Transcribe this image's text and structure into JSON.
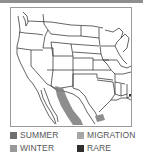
{
  "map": {
    "title": "Range map",
    "region": "United States and northern Mexico",
    "range_color": "#7a7a7a"
  },
  "legend": {
    "items": [
      {
        "label": "SUMMER",
        "color": "#6f6f6f"
      },
      {
        "label": "MIGRATION",
        "color": "#a6a6a6"
      },
      {
        "label": "WINTER",
        "color": "#999999"
      },
      {
        "label": "RARE",
        "color": "#2f2f2f"
      }
    ]
  }
}
